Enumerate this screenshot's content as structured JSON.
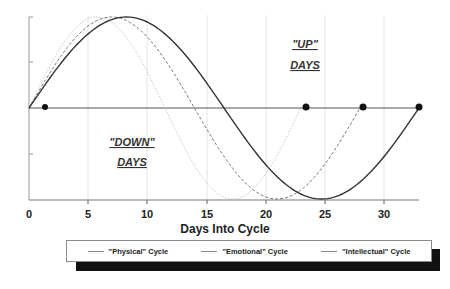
{
  "chart_data": {
    "type": "line",
    "title": "",
    "xlabel": "Days Into Cycle",
    "ylabel": "",
    "xlim": [
      0,
      33
    ],
    "ylim": [
      -1,
      1
    ],
    "x_ticks": [
      0,
      5,
      10,
      15,
      20,
      25,
      30
    ],
    "x_tick_labels": [
      "0",
      "5",
      "10",
      "15",
      "20",
      "25",
      "30"
    ],
    "grid": "vertical at each x tick",
    "series": [
      {
        "name": "\"Physical\" Cycle",
        "period_days": 23,
        "style": "dotted light gray",
        "color": "#bbbbbb",
        "start_day": 0,
        "peak_day": 5.75,
        "trough_day": 17.25,
        "end_day": 23
      },
      {
        "name": "\"Emotional\" Cycle",
        "period_days": 28,
        "style": "dashed gray",
        "color": "#777777",
        "start_day": 0,
        "peak_day": 7,
        "trough_day": 21,
        "end_day": 28
      },
      {
        "name": "\"Intellectual\" Cycle",
        "period_days": 33,
        "style": "solid dark",
        "color": "#333333",
        "start_day": 0,
        "peak_day": 8.25,
        "trough_day": 24.75,
        "end_day": 33
      }
    ],
    "markers": [
      {
        "day": 1.2,
        "value": 0
      },
      {
        "day": 23,
        "value": 0
      },
      {
        "day": 28,
        "value": 0
      },
      {
        "day": 33,
        "value": 0
      }
    ],
    "annotations": [
      {
        "text": "\"UP\"",
        "line2": "DAYS",
        "region": "above zero line"
      },
      {
        "text": "\"DOWN\"",
        "line2": "DAYS",
        "region": "below zero line"
      }
    ],
    "legend_position": "bottom"
  },
  "annotations": {
    "up_line1": "\"UP\"",
    "up_line2": "DAYS",
    "down_line1": "\"DOWN\"",
    "down_line2": "DAYS"
  },
  "axis": {
    "xlabel": "Days Into Cycle",
    "ticks": [
      "0",
      "5",
      "10",
      "15",
      "20",
      "25",
      "30"
    ]
  },
  "legend": {
    "items": [
      {
        "label": "\"Physical\" Cycle"
      },
      {
        "label": "\"Emotional\" Cycle"
      },
      {
        "label": "\"Intellectual\" Cycle"
      }
    ]
  }
}
